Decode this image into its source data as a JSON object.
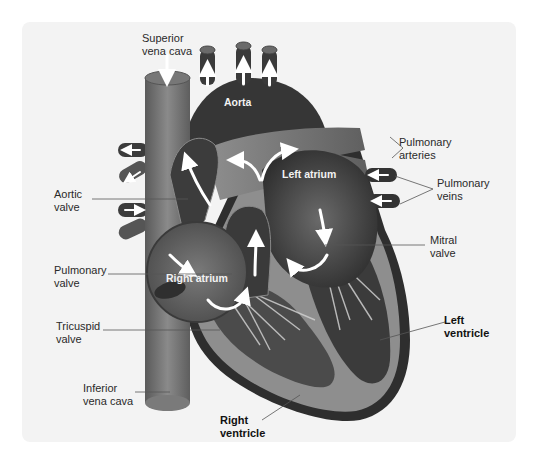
{
  "diagram": {
    "colors": {
      "background": "#ffffff",
      "panel": "#f3f3f3",
      "tissue_dark": "#3a3a3a",
      "tissue_mid": "#6b6b6b",
      "tissue_light": "#9a9a9a",
      "outer_wall": "#2e2e2e",
      "arrow": "#ffffff",
      "leader_line": "#555555"
    },
    "external_labels": {
      "superior_vena_cava": "Superior\nvena cava",
      "aortic_valve": "Aortic\nvalve",
      "pulmonary_valve": "Pulmonary\nvalve",
      "tricuspid_valve": "Tricuspid\nvalve",
      "inferior_vena_cava": "Inferior\nvena cava",
      "right_ventricle": "Right\nventricle",
      "left_ventricle": "Left\nventricle",
      "mitral_valve": "Mitral\nvalve",
      "pulmonary_veins": "Pulmonary\nveins",
      "pulmonary_arteries": "Pulmonary\narteries"
    },
    "internal_labels": {
      "aorta": "Aorta",
      "left_atrium": "Left atrium",
      "right_atrium": "Right atrium"
    },
    "arrows": [
      {
        "name": "svc-inflow",
        "direction": "down"
      },
      {
        "name": "aorta-branch-1",
        "direction": "up"
      },
      {
        "name": "aorta-branch-2",
        "direction": "up"
      },
      {
        "name": "aorta-branch-3",
        "direction": "up"
      },
      {
        "name": "left-pulmonary-artery-1",
        "direction": "left"
      },
      {
        "name": "left-pulmonary-artery-2",
        "direction": "left-down"
      },
      {
        "name": "left-pulmonary-vein",
        "direction": "right"
      },
      {
        "name": "right-pulmonary-vein-1",
        "direction": "left"
      },
      {
        "name": "right-pulmonary-vein-2",
        "direction": "left"
      },
      {
        "name": "aortic-outflow",
        "direction": "up"
      },
      {
        "name": "pulmonary-trunk-split",
        "direction": "left-right"
      },
      {
        "name": "right-ventricle-outflow",
        "direction": "up"
      },
      {
        "name": "left-atrium-to-ventricle",
        "direction": "down"
      },
      {
        "name": "mitral-curve",
        "direction": "left"
      },
      {
        "name": "right-atrium-inflow",
        "direction": "down-right"
      },
      {
        "name": "tricuspid-curve",
        "direction": "up-right"
      }
    ]
  }
}
